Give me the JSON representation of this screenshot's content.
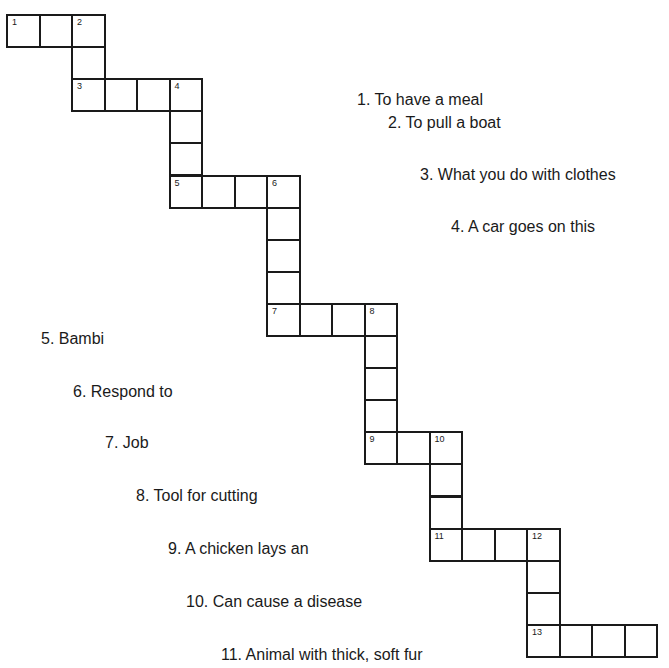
{
  "puzzle": {
    "cell_w": 32.5,
    "cell_h": 32.1,
    "origin": [
      6,
      14
    ],
    "cells": [
      {
        "c": 0,
        "r": 0,
        "n": "1"
      },
      {
        "c": 1,
        "r": 0,
        "n": ""
      },
      {
        "c": 2,
        "r": 0,
        "n": "2"
      },
      {
        "c": 2,
        "r": 1,
        "n": ""
      },
      {
        "c": 2,
        "r": 2,
        "n": "3"
      },
      {
        "c": 3,
        "r": 2,
        "n": ""
      },
      {
        "c": 4,
        "r": 2,
        "n": ""
      },
      {
        "c": 5,
        "r": 2,
        "n": "4"
      },
      {
        "c": 5,
        "r": 3,
        "n": ""
      },
      {
        "c": 5,
        "r": 4,
        "n": ""
      },
      {
        "c": 5,
        "r": 5,
        "n": "5"
      },
      {
        "c": 6,
        "r": 5,
        "n": ""
      },
      {
        "c": 7,
        "r": 5,
        "n": ""
      },
      {
        "c": 8,
        "r": 5,
        "n": "6"
      },
      {
        "c": 8,
        "r": 6,
        "n": ""
      },
      {
        "c": 8,
        "r": 7,
        "n": ""
      },
      {
        "c": 8,
        "r": 8,
        "n": ""
      },
      {
        "c": 8,
        "r": 9,
        "n": "7"
      },
      {
        "c": 9,
        "r": 9,
        "n": ""
      },
      {
        "c": 10,
        "r": 9,
        "n": ""
      },
      {
        "c": 11,
        "r": 9,
        "n": "8"
      },
      {
        "c": 11,
        "r": 10,
        "n": ""
      },
      {
        "c": 11,
        "r": 11,
        "n": ""
      },
      {
        "c": 11,
        "r": 12,
        "n": ""
      },
      {
        "c": 11,
        "r": 13,
        "n": "9"
      },
      {
        "c": 12,
        "r": 13,
        "n": ""
      },
      {
        "c": 13,
        "r": 13,
        "n": "10"
      },
      {
        "c": 13,
        "r": 14,
        "n": ""
      },
      {
        "c": 13,
        "r": 15,
        "n": ""
      },
      {
        "c": 13,
        "r": 16,
        "n": "11"
      },
      {
        "c": 14,
        "r": 16,
        "n": ""
      },
      {
        "c": 15,
        "r": 16,
        "n": ""
      },
      {
        "c": 16,
        "r": 16,
        "n": "12"
      },
      {
        "c": 16,
        "r": 17,
        "n": ""
      },
      {
        "c": 16,
        "r": 18,
        "n": ""
      },
      {
        "c": 16,
        "r": 19,
        "n": "13"
      },
      {
        "c": 17,
        "r": 19,
        "n": ""
      },
      {
        "c": 18,
        "r": 19,
        "n": ""
      },
      {
        "c": 19,
        "r": 19,
        "n": ""
      }
    ]
  },
  "clues": [
    {
      "text": "1. To have a meal",
      "x": 357,
      "y": 90
    },
    {
      "text": "2. To pull a boat",
      "x": 388,
      "y": 113
    },
    {
      "text": "3. What you do with clothes",
      "x": 420,
      "y": 165
    },
    {
      "text": "4. A car goes on this",
      "x": 451,
      "y": 217
    },
    {
      "text": "5. Bambi",
      "x": 41,
      "y": 329
    },
    {
      "text": "6. Respond to",
      "x": 73,
      "y": 382
    },
    {
      "text": "7. Job",
      "x": 105,
      "y": 433
    },
    {
      "text": "8. Tool for cutting",
      "x": 136,
      "y": 486
    },
    {
      "text": "9. A chicken lays an",
      "x": 168,
      "y": 539
    },
    {
      "text": "10.  Can cause a disease",
      "x": 186,
      "y": 592
    },
    {
      "text": "11.  Animal with thick, soft fur",
      "x": 221,
      "y": 645
    }
  ]
}
